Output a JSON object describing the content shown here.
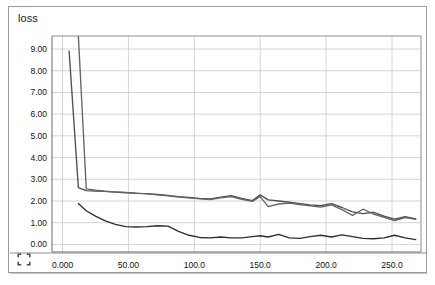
{
  "widget": {
    "title": "loss",
    "expand_icon": "expand-fullscreen-icon"
  },
  "chart_data": {
    "type": "line",
    "title": "loss",
    "xlabel": "",
    "ylabel": "",
    "xlim": [
      -8,
      272
    ],
    "ylim": [
      -0.35,
      9.6
    ],
    "grid": true,
    "legend": null,
    "x_ticks": [
      0,
      50,
      100,
      150,
      200,
      250
    ],
    "x_tick_labels": [
      "0.000",
      "50.00",
      "100.0",
      "150.0",
      "200.0",
      "250.0"
    ],
    "y_ticks": [
      0,
      1,
      2,
      3,
      4,
      5,
      6,
      7,
      8,
      9
    ],
    "y_tick_labels": [
      "0.00",
      "1.00",
      "2.00",
      "3.00",
      "4.00",
      "5.00",
      "6.00",
      "7.00",
      "8.00",
      "9.00"
    ],
    "colors": [
      "#4f4f4f",
      "#656565",
      "#2e2e2e"
    ],
    "series": [
      {
        "name": "series-1",
        "color": "#4f4f4f",
        "x": [
          5,
          12,
          18,
          25,
          32,
          40,
          48,
          56,
          64,
          72,
          80,
          88,
          96,
          104,
          112,
          120,
          128,
          136,
          144,
          150,
          156,
          164,
          172,
          180,
          188,
          196,
          204,
          212,
          220,
          228,
          236,
          244,
          252,
          260,
          268
        ],
        "y": [
          8.9,
          2.62,
          2.48,
          2.46,
          2.44,
          2.41,
          2.38,
          2.35,
          2.34,
          2.3,
          2.26,
          2.2,
          2.16,
          2.12,
          2.1,
          2.18,
          2.24,
          2.12,
          2.02,
          2.28,
          2.05,
          2.0,
          1.94,
          1.88,
          1.82,
          1.78,
          1.88,
          1.7,
          1.5,
          1.42,
          1.48,
          1.3,
          1.16,
          1.28,
          1.18
        ]
      },
      {
        "name": "series-2",
        "color": "#656565",
        "x": [
          12,
          18,
          25,
          32,
          40,
          48,
          56,
          64,
          72,
          80,
          88,
          96,
          104,
          112,
          120,
          128,
          136,
          144,
          150,
          156,
          164,
          172,
          180,
          188,
          196,
          204,
          212,
          220,
          228,
          236,
          244,
          252,
          260,
          268
        ],
        "y": [
          9.6,
          2.56,
          2.5,
          2.45,
          2.42,
          2.4,
          2.36,
          2.33,
          2.28,
          2.24,
          2.18,
          2.14,
          2.1,
          2.06,
          2.14,
          2.2,
          2.08,
          1.98,
          2.2,
          1.74,
          1.86,
          1.9,
          1.84,
          1.78,
          1.72,
          1.82,
          1.6,
          1.34,
          1.62,
          1.4,
          1.25,
          1.1,
          1.24,
          1.15
        ]
      },
      {
        "name": "series-3",
        "color": "#2e2e2e",
        "x": [
          12,
          18,
          25,
          32,
          40,
          48,
          56,
          64,
          72,
          80,
          88,
          96,
          104,
          112,
          120,
          128,
          136,
          144,
          150,
          156,
          164,
          172,
          180,
          188,
          196,
          204,
          212,
          220,
          228,
          236,
          244,
          252,
          260,
          268
        ],
        "y": [
          1.88,
          1.55,
          1.3,
          1.1,
          0.92,
          0.82,
          0.8,
          0.82,
          0.86,
          0.84,
          0.6,
          0.42,
          0.32,
          0.3,
          0.34,
          0.3,
          0.3,
          0.36,
          0.4,
          0.34,
          0.46,
          0.3,
          0.28,
          0.36,
          0.42,
          0.34,
          0.44,
          0.36,
          0.28,
          0.26,
          0.3,
          0.42,
          0.3,
          0.22
        ]
      }
    ]
  }
}
